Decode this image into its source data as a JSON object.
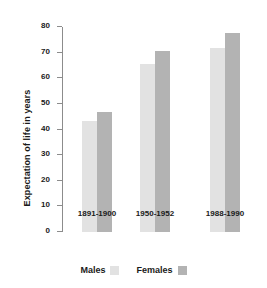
{
  "chart_data": {
    "type": "bar",
    "title": "",
    "xlabel": "",
    "ylabel": "Expectation of life in years",
    "categories": [
      "1891-1900",
      "1950-1952",
      "1988-1990"
    ],
    "series": [
      {
        "name": "Males",
        "values": [
          43.5,
          65.5,
          72.0
        ],
        "color": "#e2e2e2"
      },
      {
        "name": "Females",
        "values": [
          47.0,
          70.5,
          77.5
        ],
        "color": "#b3b3b3"
      }
    ],
    "ylim": [
      0,
      80
    ],
    "yticks": [
      0,
      10,
      20,
      30,
      40,
      50,
      60,
      70,
      80
    ],
    "ytick_labels": [
      "0",
      "10",
      "20",
      "30",
      "40",
      "50",
      "60",
      "70",
      "80"
    ],
    "grid": false,
    "legend_position": "bottom-center"
  },
  "legend": {
    "items": [
      {
        "label": "Males",
        "swatch": "males-swatch"
      },
      {
        "label": "Females",
        "swatch": "females-swatch"
      }
    ]
  }
}
